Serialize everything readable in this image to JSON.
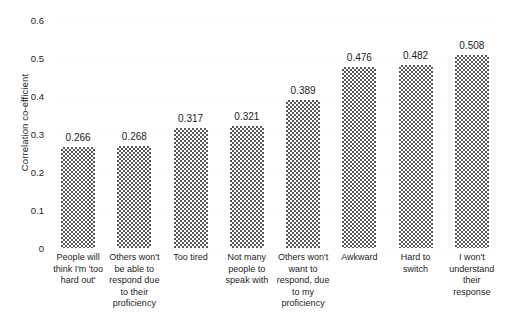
{
  "chart_data": {
    "type": "bar",
    "title": "",
    "subtitle": "",
    "xlabel": "",
    "ylabel": "Correlation co-efficient",
    "ylim": [
      0,
      0.6
    ],
    "ytick_labels": [
      "0",
      "0.1",
      "0.2",
      "0.3",
      "0.4",
      "0.5",
      "0.6"
    ],
    "ytick_values": [
      0,
      0.1,
      0.2,
      0.3,
      0.4,
      0.5,
      0.6
    ],
    "grid": true,
    "legend": false,
    "legend_position": "none",
    "bar_fill_color": "#565656",
    "bar_pattern": "checkerboard",
    "categories": [
      "People will think I'm 'too hard out'",
      "Others won't be able to respond due to their proficiency",
      "Too tired",
      "Not many people to speak with",
      "Others won't want to respond, due to my proficiency",
      "Awkward",
      "Hard to switch",
      "I won't understand their response"
    ],
    "values": [
      0.266,
      0.268,
      0.317,
      0.321,
      0.389,
      0.476,
      0.482,
      0.508
    ],
    "value_labels": [
      "0.266",
      "0.268",
      "0.317",
      "0.321",
      "0.389",
      "0.476",
      "0.482",
      "0.508"
    ]
  }
}
